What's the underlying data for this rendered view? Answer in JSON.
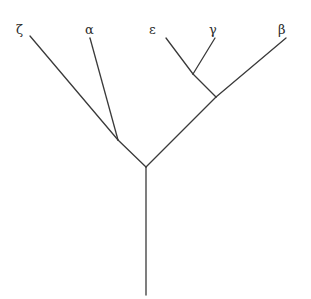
{
  "figure": {
    "name": "phylogenetic-tree",
    "width": 311,
    "height": 299,
    "background_color": "#ffffff",
    "line_color": "#3a3a3a",
    "line_width": 1.3,
    "label_color": "#2b2b2b"
  },
  "labels": {
    "zeta": "ζ",
    "alpha": "α",
    "epsilon": "ε",
    "gamma": "γ",
    "beta": "β"
  },
  "chart_data": {
    "type": "diagram",
    "title": "",
    "subtitle": "",
    "xlabel": "",
    "ylabel": "",
    "grid": false,
    "legend": "none",
    "diagram_kind": "rooted-phylogenetic-tree",
    "taxa": [
      "ζ",
      "α",
      "ε",
      "γ",
      "β"
    ],
    "nodes": [
      {
        "id": "root_base",
        "label": "",
        "x": 146,
        "y": 295,
        "kind": "root-tip"
      },
      {
        "id": "root",
        "label": "",
        "x": 146,
        "y": 167,
        "kind": "internal"
      },
      {
        "id": "n_left",
        "label": "",
        "x": 118,
        "y": 140,
        "kind": "internal"
      },
      {
        "id": "n_right",
        "label": "",
        "x": 216,
        "y": 97,
        "kind": "internal"
      },
      {
        "id": "n_right_inner",
        "label": "",
        "x": 193,
        "y": 74,
        "kind": "internal"
      },
      {
        "id": "tip_zeta",
        "label": "ζ",
        "x": 30,
        "y": 36,
        "kind": "tip"
      },
      {
        "id": "tip_alpha",
        "label": "α",
        "x": 90,
        "y": 38,
        "kind": "tip"
      },
      {
        "id": "tip_epsilon",
        "label": "ε",
        "x": 166,
        "y": 38,
        "kind": "tip"
      },
      {
        "id": "tip_gamma",
        "label": "γ",
        "x": 215,
        "y": 38,
        "kind": "tip"
      },
      {
        "id": "tip_beta",
        "label": "β",
        "x": 286,
        "y": 38,
        "kind": "tip"
      }
    ],
    "edges": [
      {
        "from": "root",
        "to": "root_base",
        "name": "root-stem"
      },
      {
        "from": "root",
        "to": "n_left",
        "name": "root-to-left-clade"
      },
      {
        "from": "n_left",
        "to": "tip_zeta",
        "name": "branch-zeta"
      },
      {
        "from": "n_left",
        "to": "tip_alpha",
        "name": "branch-alpha"
      },
      {
        "from": "root",
        "to": "n_right",
        "name": "root-to-right-clade"
      },
      {
        "from": "n_right",
        "to": "tip_beta",
        "name": "branch-beta"
      },
      {
        "from": "n_right",
        "to": "n_right_inner",
        "name": "right-clade-internal"
      },
      {
        "from": "n_right_inner",
        "to": "tip_epsilon",
        "name": "branch-epsilon"
      },
      {
        "from": "n_right_inner",
        "to": "tip_gamma",
        "name": "branch-gamma"
      }
    ],
    "label_positions": [
      {
        "taxon": "ζ",
        "x": 16,
        "y": 23
      },
      {
        "taxon": "α",
        "x": 85,
        "y": 23
      },
      {
        "taxon": "ε",
        "x": 149,
        "y": 23
      },
      {
        "taxon": "γ",
        "x": 209,
        "y": 23
      },
      {
        "taxon": "β",
        "x": 278,
        "y": 23
      }
    ]
  }
}
